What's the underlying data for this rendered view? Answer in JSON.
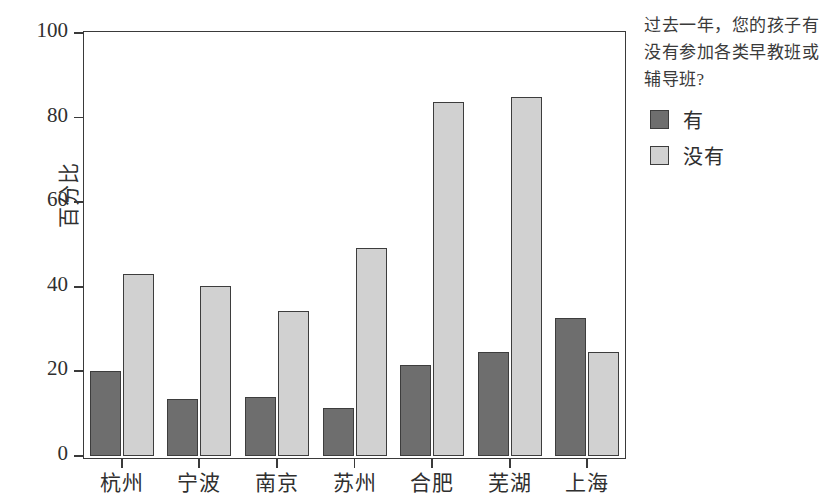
{
  "chart_data": {
    "type": "bar",
    "title": "",
    "xlabel": "",
    "ylabel": "百分比",
    "categories": [
      "杭州",
      "宁波",
      "南京",
      "苏州",
      "合肥",
      "芜湖",
      "上海"
    ],
    "series": [
      {
        "name": "有",
        "values": [
          20.0,
          13.5,
          14.0,
          11.4,
          21.4,
          24.5,
          32.6
        ]
      },
      {
        "name": "没有",
        "values": [
          43.1,
          40.2,
          34.2,
          49.2,
          83.7,
          84.8,
          24.6
        ]
      }
    ],
    "ylim": [
      0,
      100
    ],
    "yticks": [
      0,
      20,
      40,
      60,
      80,
      100
    ],
    "ytick_labels": [
      "0",
      "20",
      "40",
      "60",
      "80",
      "100"
    ],
    "grid": false,
    "legend_position": "right",
    "legend_title": "过去一年，您的孩子有没有参加各类早教班或辅导班?",
    "colors": {
      "series_yes": "#6e6e6e",
      "series_no": "#d1d1d1",
      "edge": "#3d3d3d",
      "axis": "#3a3a3a"
    }
  },
  "legend": {
    "title_lines": [
      "过去一年，您的孩子有",
      "没有参加各类早教班或",
      "辅导班?"
    ]
  }
}
